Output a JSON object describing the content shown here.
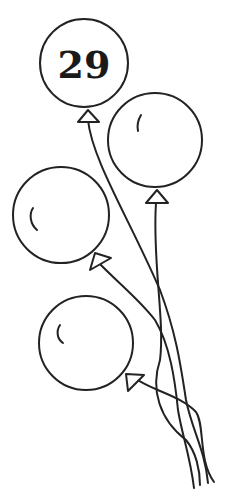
{
  "illustration": {
    "subject": "bunch of four balloons with tied strings",
    "stroke_color": "#222222",
    "background_color": "#ffffff",
    "balloons": [
      {
        "id": "balloon-1",
        "label": "29"
      },
      {
        "id": "balloon-2",
        "label": ""
      },
      {
        "id": "balloon-3",
        "label": ""
      },
      {
        "id": "balloon-4",
        "label": ""
      }
    ]
  }
}
